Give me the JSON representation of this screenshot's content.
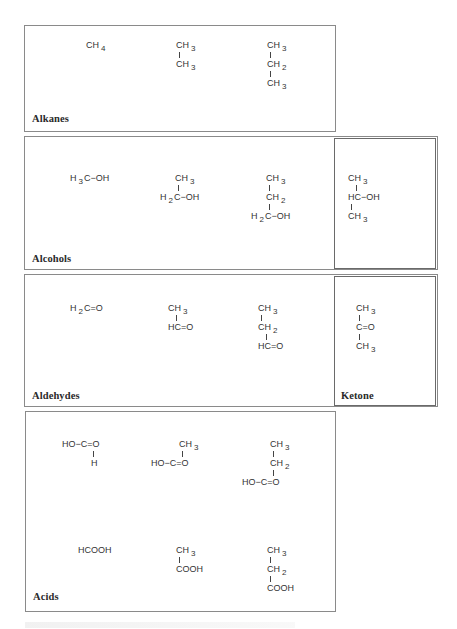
{
  "sections": {
    "alkanes": {
      "label": "Alkanes",
      "molecules": [
        {
          "name": "methane",
          "lines": [
            [
              "CH",
              "4"
            ]
          ]
        },
        {
          "name": "ethane",
          "lines": [
            [
              "CH",
              "3"
            ],
            [
              "|",
              ""
            ],
            [
              "CH",
              "3"
            ]
          ]
        },
        {
          "name": "propane",
          "lines": [
            [
              "CH",
              "3"
            ],
            [
              "|",
              ""
            ],
            [
              "CH",
              "2"
            ],
            [
              "|",
              ""
            ],
            [
              "CH",
              "3"
            ]
          ]
        }
      ]
    },
    "alcohols": {
      "label": "Alcohols",
      "molecules": [
        {
          "name": "methanol",
          "lines": [
            [
              "H",
              "3",
              "C−OH"
            ]
          ]
        },
        {
          "name": "ethanol",
          "lines": [
            [
              "CH",
              "3"
            ],
            [
              "|",
              ""
            ],
            [
              "H",
              "2",
              "C−OH"
            ]
          ]
        },
        {
          "name": "propanol",
          "lines": [
            [
              "CH",
              "3"
            ],
            [
              "|",
              ""
            ],
            [
              "CH",
              "2"
            ],
            [
              "|",
              ""
            ],
            [
              "H",
              "2",
              "C−OH"
            ]
          ]
        },
        {
          "name": "isopropanol",
          "lines": [
            [
              "CH",
              "3"
            ],
            [
              "|",
              ""
            ],
            [
              "HC−OH",
              ""
            ],
            [
              "|",
              ""
            ],
            [
              "CH",
              "3"
            ]
          ]
        }
      ]
    },
    "aldehydes": {
      "label": "Aldehydes",
      "molecules": [
        {
          "name": "formaldehyde",
          "lines": [
            [
              "H",
              "2",
              "C=O"
            ]
          ]
        },
        {
          "name": "acetaldehyde",
          "lines": [
            [
              "CH",
              "3"
            ],
            [
              "|",
              ""
            ],
            [
              "HC=O",
              ""
            ]
          ]
        },
        {
          "name": "propanal",
          "lines": [
            [
              "CH",
              "3"
            ],
            [
              "|",
              ""
            ],
            [
              "CH",
              "2"
            ],
            [
              "|",
              ""
            ],
            [
              "HC=O",
              ""
            ]
          ]
        }
      ]
    },
    "ketone": {
      "label": "Ketone",
      "molecules": [
        {
          "name": "acetone",
          "lines": [
            [
              "CH",
              "3"
            ],
            [
              "|",
              ""
            ],
            [
              "C=O",
              ""
            ],
            [
              "|",
              ""
            ],
            [
              "CH",
              "3"
            ]
          ]
        }
      ]
    },
    "acids": {
      "label": "Acids",
      "molecules": [
        {
          "name": "formic-acid-structural",
          "lines": [
            [
              "HO−C=O",
              ""
            ],
            [
              "|",
              ""
            ],
            [
              "H",
              ""
            ]
          ]
        },
        {
          "name": "acetic-acid-structural",
          "lines": [
            [
              "CH",
              "3"
            ],
            [
              "|",
              ""
            ],
            [
              "HO−C=O",
              ""
            ]
          ]
        },
        {
          "name": "propanoic-acid-structural",
          "lines": [
            [
              "CH",
              "3"
            ],
            [
              "|",
              ""
            ],
            [
              "CH",
              "2"
            ],
            [
              "|",
              ""
            ],
            [
              "HO−C=O",
              ""
            ]
          ]
        },
        {
          "name": "formic-acid-condensed",
          "lines": [
            [
              "HCOOH",
              ""
            ]
          ]
        },
        {
          "name": "acetic-acid-condensed",
          "lines": [
            [
              "CH",
              "3"
            ],
            [
              "|",
              ""
            ],
            [
              "COOH",
              ""
            ]
          ]
        },
        {
          "name": "propanoic-acid-condensed",
          "lines": [
            [
              "CH",
              "3"
            ],
            [
              "|",
              ""
            ],
            [
              "CH",
              "2"
            ],
            [
              "|",
              ""
            ],
            [
              "COOH",
              ""
            ]
          ]
        }
      ]
    }
  }
}
